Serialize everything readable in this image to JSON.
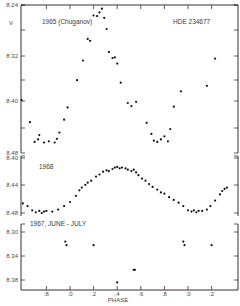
{
  "chart_data": [
    {
      "type": "scatter",
      "panel": "top",
      "title": "1965 (Chuganov)",
      "annotation": "HDE 234677",
      "ylabel": "V",
      "yticks": [
        "8.24",
        "8.32",
        "8.40",
        "8.48"
      ],
      "ylim": [
        8.24,
        8.48
      ],
      "y_inverted": true,
      "points": [
        [
          -0.6,
          8.322
        ],
        [
          -0.59,
          8.329
        ],
        [
          -0.52,
          8.372
        ],
        [
          -0.48,
          8.399
        ],
        [
          -0.45,
          8.404
        ],
        [
          -0.41,
          8.394
        ],
        [
          -0.34,
          8.43
        ],
        [
          -0.3,
          8.462
        ],
        [
          -0.27,
          8.458
        ],
        [
          -0.26,
          8.451
        ],
        [
          -0.22,
          8.463
        ],
        [
          -0.18,
          8.461
        ],
        [
          -0.13,
          8.463
        ],
        [
          -0.11,
          8.457
        ],
        [
          -0.09,
          8.447
        ],
        [
          -0.05,
          8.426
        ],
        [
          -0.02,
          8.406
        ],
        [
          0.06,
          8.362
        ],
        [
          0.11,
          8.33
        ],
        [
          0.15,
          8.295
        ],
        [
          0.17,
          8.298
        ],
        [
          0.2,
          8.257
        ],
        [
          0.23,
          8.258
        ],
        [
          0.25,
          8.252
        ],
        [
          0.27,
          8.246
        ],
        [
          0.29,
          8.261
        ],
        [
          0.31,
          8.279
        ],
        [
          0.33,
          8.316
        ],
        [
          0.36,
          8.326
        ],
        [
          0.38,
          8.325
        ],
        [
          0.4,
          8.335
        ],
        [
          0.43,
          8.366
        ],
        [
          0.49,
          8.399
        ],
        [
          0.52,
          8.404
        ],
        [
          0.56,
          8.397
        ],
        [
          0.65,
          8.431
        ],
        [
          0.69,
          8.449
        ],
        [
          0.71,
          8.46
        ],
        [
          0.74,
          8.462
        ],
        [
          0.77,
          8.458
        ],
        [
          0.8,
          8.453
        ],
        [
          0.83,
          8.461
        ],
        [
          0.85,
          8.441
        ],
        [
          0.88,
          8.405
        ],
        [
          0.94,
          8.38
        ],
        [
          1.16,
          8.371
        ],
        [
          1.23,
          8.327
        ]
      ]
    },
    {
      "type": "scatter",
      "panel": "middle",
      "title": "1968",
      "yticks": [
        "8.40",
        "8.44",
        "8.48"
      ],
      "ylim": [
        8.4,
        8.48
      ],
      "y_inverted": true,
      "points": [
        [
          -0.61,
          8.443
        ],
        [
          -0.58,
          8.445
        ],
        [
          -0.55,
          8.448
        ],
        [
          -0.52,
          8.452
        ],
        [
          -0.49,
          8.455
        ],
        [
          -0.47,
          8.458
        ],
        [
          -0.43,
          8.461
        ],
        [
          -0.4,
          8.466
        ],
        [
          -0.36,
          8.47
        ],
        [
          -0.32,
          8.476
        ],
        [
          -0.29,
          8.479
        ],
        [
          -0.26,
          8.477
        ],
        [
          -0.24,
          8.48
        ],
        [
          -0.22,
          8.478
        ],
        [
          -0.2,
          8.477
        ],
        [
          -0.15,
          8.478
        ],
        [
          -0.1,
          8.475
        ],
        [
          -0.05,
          8.47
        ],
        [
          0.0,
          8.464
        ],
        [
          0.05,
          8.455
        ],
        [
          0.08,
          8.447
        ],
        [
          0.1,
          8.443
        ],
        [
          0.13,
          8.439
        ],
        [
          0.15,
          8.436
        ],
        [
          0.18,
          8.433
        ],
        [
          0.22,
          8.427
        ],
        [
          0.25,
          8.424
        ],
        [
          0.28,
          8.42
        ],
        [
          0.31,
          8.418
        ],
        [
          0.33,
          8.419
        ],
        [
          0.36,
          8.416
        ],
        [
          0.38,
          8.414
        ],
        [
          0.4,
          8.413
        ],
        [
          0.42,
          8.415
        ],
        [
          0.44,
          8.414
        ],
        [
          0.47,
          8.415
        ],
        [
          0.49,
          8.417
        ],
        [
          0.52,
          8.419
        ],
        [
          0.54,
          8.417
        ],
        [
          0.56,
          8.421
        ],
        [
          0.58,
          8.425
        ],
        [
          0.61,
          8.43
        ],
        [
          0.64,
          8.433
        ],
        [
          0.67,
          8.438
        ],
        [
          0.7,
          8.442
        ],
        [
          0.74,
          8.446
        ],
        [
          0.77,
          8.45
        ],
        [
          0.8,
          8.452
        ],
        [
          0.84,
          8.457
        ],
        [
          0.88,
          8.461
        ],
        [
          0.92,
          8.465
        ],
        [
          0.96,
          8.47
        ],
        [
          1.0,
          8.476
        ],
        [
          1.03,
          8.478
        ],
        [
          1.05,
          8.476
        ],
        [
          1.07,
          8.479
        ],
        [
          1.09,
          8.477
        ],
        [
          1.12,
          8.477
        ],
        [
          1.16,
          8.475
        ],
        [
          1.19,
          8.47
        ],
        [
          1.23,
          8.462
        ],
        [
          1.27,
          8.453
        ],
        [
          1.29,
          8.448
        ],
        [
          1.31,
          8.445
        ],
        [
          1.33,
          8.443
        ]
      ]
    },
    {
      "type": "scatter",
      "panel": "bottom",
      "title": "1967, JUNE - JULY",
      "yticks": [
        "8.30",
        "8.34",
        "8.38"
      ],
      "ylim": [
        8.28,
        8.4
      ],
      "y_inverted": true,
      "points": [
        [
          -0.04,
          8.316
        ],
        [
          -0.03,
          8.322
        ],
        [
          0.2,
          8.322
        ],
        [
          0.4,
          8.384
        ],
        [
          0.54,
          8.363
        ],
        [
          0.55,
          8.363
        ],
        [
          0.96,
          8.316
        ],
        [
          0.97,
          8.322
        ],
        [
          1.2,
          8.322
        ]
      ]
    }
  ],
  "figure": {
    "xlabel": "PHASE",
    "xticks": [
      ".8",
      ".0",
      ".2",
      ".4",
      ".6",
      ".8",
      ".0",
      ".2"
    ],
    "xtick_values": [
      -0.2,
      0.0,
      0.2,
      0.4,
      0.6,
      0.8,
      1.0,
      1.2
    ],
    "xlim": [
      -0.62,
      1.4
    ],
    "grid": false
  },
  "labels": {
    "top_title": "1965 (Chuganov)",
    "star_id": "HDE 234677",
    "ylabel": "V",
    "middle_title": "1968",
    "bottom_title": "1967, JUNE - JULY",
    "xlabel": "PHASE"
  }
}
